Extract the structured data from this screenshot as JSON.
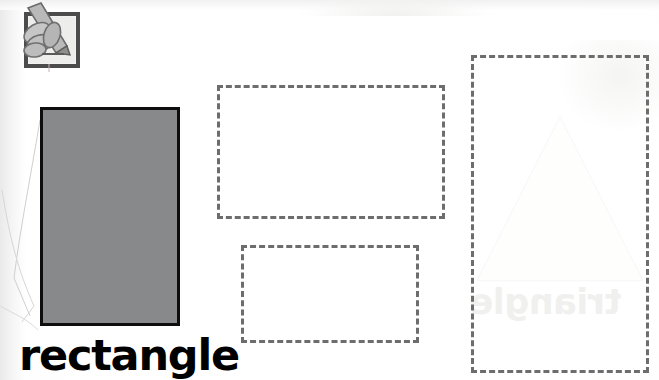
{
  "worksheet": {
    "shape_label": "rectangle",
    "instruction_icon": "hand-holding-pencil-tracing-icon",
    "model_shape": {
      "name": "rectangle",
      "fill_color": "#87898a",
      "stroke_color": "#0e0e0e"
    },
    "trace_outlines": [
      {
        "name": "trace-rectangle-large",
        "style": "dashed",
        "color": "#6d6d6d"
      },
      {
        "name": "trace-rectangle-small",
        "style": "dashed",
        "color": "#6d6d6d"
      },
      {
        "name": "trace-rectangle-tall",
        "style": "dashed",
        "color": "#6d6d6d"
      }
    ],
    "bleed_through": {
      "word": "triangle",
      "shape": "triangle",
      "color": "#f0f0ef"
    },
    "page_background": "#ffffff"
  }
}
